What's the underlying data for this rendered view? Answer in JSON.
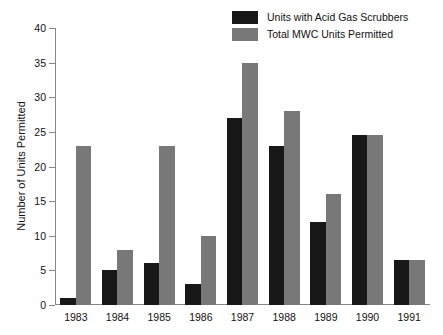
{
  "chart_data": {
    "type": "bar",
    "title": "",
    "xlabel": "",
    "ylabel": "Number of Units Permitted",
    "categories": [
      "1983",
      "1984",
      "1985",
      "1986",
      "1987",
      "1988",
      "1989",
      "1990",
      "1991"
    ],
    "series": [
      {
        "name": "Units with Acid Gas Scrubbers",
        "color": "#181818",
        "values": [
          1,
          5,
          6,
          3,
          27,
          23,
          12,
          24.5,
          6.5
        ]
      },
      {
        "name": "Total MWC Units Permitted",
        "color": "#787878",
        "values": [
          23,
          8,
          23,
          10,
          35,
          28,
          16,
          24.5,
          6.5
        ]
      }
    ],
    "ylim": [
      0,
      40
    ],
    "ytick_values": [
      0,
      5,
      10,
      15,
      20,
      25,
      30,
      35,
      40
    ],
    "ytick_labels": [
      "0",
      "5",
      "10",
      "15",
      "20",
      "25",
      "30",
      "35",
      "40"
    ],
    "grid": false,
    "legend_position": "top-right"
  },
  "legend": {
    "entries": [
      {
        "label": "Units with Acid Gas Scrubbers",
        "swatch": "#181818"
      },
      {
        "label": "Total MWC Units Permitted",
        "swatch": "#787878"
      }
    ]
  }
}
